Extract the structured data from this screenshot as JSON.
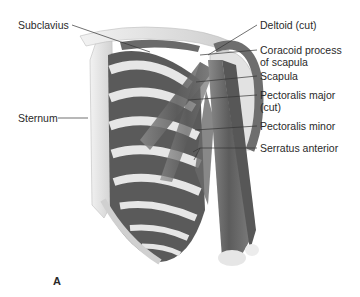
{
  "figure": {
    "panel_label": "A",
    "colors": {
      "background": "#ffffff",
      "muscle": "#6f6f6f",
      "muscle_dark": "#4a4a4a",
      "bone": "#d9d9d9",
      "bone_light": "#ececec",
      "leader_line": "#333333",
      "text": "#2a2a2a"
    },
    "labels_left": [
      {
        "text": "Subclavius"
      },
      {
        "text": "Sternum"
      }
    ],
    "labels_right": [
      {
        "text": "Deltoid (cut)"
      },
      {
        "line1": "Coracoid process",
        "line2": "of scapula"
      },
      {
        "text": "Scapula"
      },
      {
        "line1": "Pectoralis major",
        "line2": "(cut)"
      },
      {
        "text": "Pectoralis minor"
      },
      {
        "text": "Serratus anterior"
      }
    ]
  }
}
